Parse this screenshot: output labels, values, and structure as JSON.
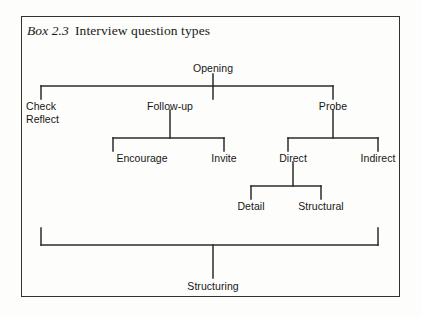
{
  "box": {
    "label": "Box 2.3",
    "caption": "Interview question types"
  },
  "diagram": {
    "type": "tree",
    "orientation": "top-down",
    "root": "Opening",
    "nodes": [
      {
        "id": "opening",
        "label": "Opening",
        "level": 0,
        "x": 213,
        "y": 68
      },
      {
        "id": "check",
        "label": "Check",
        "level": 1,
        "x": 26,
        "y": 105
      },
      {
        "id": "reflect",
        "label": "Reflect",
        "level": 1,
        "x": 26,
        "y": 118
      },
      {
        "id": "follow-up",
        "label": "Follow-up",
        "level": 1,
        "x": 170,
        "y": 105
      },
      {
        "id": "probe",
        "label": "Probe",
        "level": 1,
        "x": 333,
        "y": 105
      },
      {
        "id": "encourage",
        "label": "Encourage",
        "level": 2,
        "x": 142,
        "y": 157
      },
      {
        "id": "invite",
        "label": "Invite",
        "level": 2,
        "x": 224,
        "y": 157
      },
      {
        "id": "direct",
        "label": "Direct",
        "level": 2,
        "x": 293,
        "y": 157
      },
      {
        "id": "indirect",
        "label": "Indirect",
        "level": 2,
        "x": 378,
        "y": 157
      },
      {
        "id": "detail",
        "label": "Detail",
        "level": 3,
        "x": 251,
        "y": 205
      },
      {
        "id": "structural",
        "label": "Structural",
        "level": 3,
        "x": 321,
        "y": 205
      },
      {
        "id": "structuring",
        "label": "Structuring",
        "level": 4,
        "x": 213,
        "y": 285
      }
    ],
    "edges": [
      {
        "from": "opening",
        "to": "check"
      },
      {
        "from": "opening",
        "to": "follow-up"
      },
      {
        "from": "opening",
        "to": "probe"
      },
      {
        "from": "follow-up",
        "to": "encourage"
      },
      {
        "from": "follow-up",
        "to": "invite"
      },
      {
        "from": "probe",
        "to": "direct"
      },
      {
        "from": "probe",
        "to": "indirect"
      },
      {
        "from": "direct",
        "to": "detail"
      },
      {
        "from": "direct",
        "to": "structural"
      },
      {
        "from": "bracket",
        "to": "structuring"
      }
    ],
    "line_color": "#2b2b2b"
  }
}
